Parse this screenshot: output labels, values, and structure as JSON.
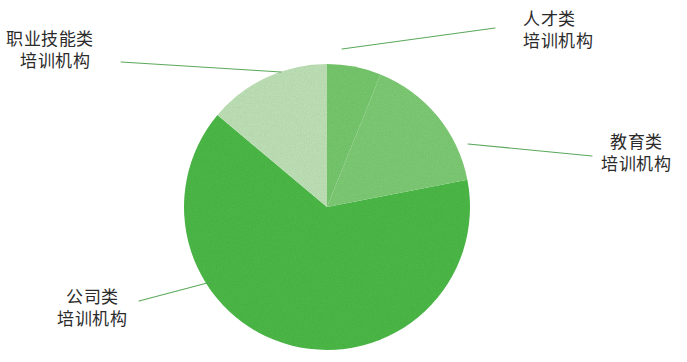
{
  "chart_data": {
    "type": "pie",
    "title": "",
    "subtitle": "",
    "xlabel": "",
    "ylabel": "",
    "grid": false,
    "legend_position": "callout-labels",
    "center": {
      "x": 327,
      "y": 207
    },
    "radius": 143,
    "start_angle_deg": 0,
    "direction": "clockwise",
    "categories": [
      "人才类\n培训机构",
      "教育类\n培训机构",
      "公司类\n培训机构",
      "职业技能类\n培训机构"
    ],
    "values": [
      6,
      16,
      64,
      14
    ],
    "slices": [
      {
        "name": "talent",
        "label_line1": "人才类",
        "label_line2": "培训机构",
        "value": 6,
        "start_deg": 0,
        "end_deg": 22,
        "color": "#76c86d",
        "leader": {
          "x1": 342,
          "y1": 49,
          "x2": 495,
          "y2": 28
        }
      },
      {
        "name": "education",
        "label_line1": "教育类",
        "label_line2": "培训机构",
        "value": 16,
        "start_deg": 22,
        "end_deg": 79,
        "color": "#7ecb74",
        "leader": {
          "x1": 468,
          "y1": 144,
          "x2": 592,
          "y2": 156
        }
      },
      {
        "name": "company",
        "label_line1": "公司类",
        "label_line2": "培训机构",
        "value": 64,
        "start_deg": 79,
        "end_deg": 310,
        "color": "#4cba47",
        "leader": {
          "x1": 211,
          "y1": 282,
          "x2": 139,
          "y2": 301
        }
      },
      {
        "name": "vocational",
        "label_line1": "职业技能类",
        "label_line2": "培训机构",
        "value": 14,
        "start_deg": 310,
        "end_deg": 360,
        "color": "#bfe2b7",
        "leader": {
          "x1": 281,
          "y1": 72,
          "x2": 121,
          "y2": 62
        }
      }
    ],
    "colors": {
      "lightest": "#bfe2b7",
      "medium_light": "#7ecb74",
      "medium": "#76c86d",
      "dark": "#4cba47",
      "leader_line": "#5aa85a",
      "text": "#2b2b2b",
      "background": "#ffffff"
    }
  }
}
